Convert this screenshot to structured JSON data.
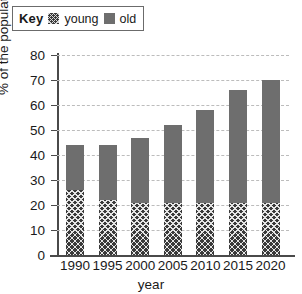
{
  "legend": {
    "key_word": "Key",
    "entries": [
      {
        "label": "young",
        "swatch": "crosshatch-swatch",
        "color": "#3a3a3a"
      },
      {
        "label": "old",
        "swatch": "solid-gray-swatch",
        "color": "#6e6e6e"
      }
    ]
  },
  "chart_data": {
    "type": "bar",
    "title": "",
    "subtitle": "",
    "stacked": true,
    "xlabel": "year",
    "ylabel": "% of the population",
    "categories": [
      "1990",
      "1995",
      "2000",
      "2005",
      "2010",
      "2015",
      "2020"
    ],
    "series": [
      {
        "name": "young",
        "values": [
          26,
          22,
          21,
          21,
          21,
          21,
          21
        ],
        "color": "#3a3a3a",
        "pattern": "crosshatch"
      },
      {
        "name": "old",
        "values": [
          18,
          22,
          26,
          31,
          37,
          45,
          49
        ],
        "color": "#6e6e6e",
        "pattern": "solid"
      }
    ],
    "totals": [
      44,
      44,
      47,
      52,
      58,
      66,
      70
    ],
    "ylim": [
      0,
      80
    ],
    "yticks": [
      0,
      10,
      20,
      30,
      40,
      50,
      60,
      70,
      80
    ],
    "ytick_labels": [
      "0",
      "10",
      "20",
      "30",
      "40",
      "50",
      "60",
      "70",
      "80"
    ],
    "grid": true,
    "grid_style": "dashed",
    "grid_color": "#bcbcbc",
    "legend_position": "top-left",
    "axis_color": "#4a4a4a"
  }
}
